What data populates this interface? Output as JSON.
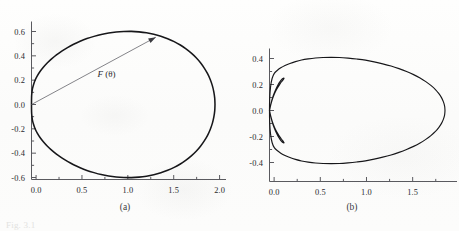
{
  "figure": {
    "caption_partial": "Fig. 3.1",
    "panels": [
      {
        "id": "a",
        "label": "(a)"
      },
      {
        "id": "b",
        "label": "(b)"
      }
    ]
  },
  "chart_data": [
    {
      "type": "line",
      "panel": "a",
      "title": "",
      "subcaption": "(a)",
      "description": "Cardioid-like closed polar curve r = F(theta), drawn in Cartesian x-y coordinates, with a radius vector annotated F (theta) drawn from the origin to a point on the upper part of the curve.",
      "xlabel": "",
      "ylabel": "",
      "xlim": [
        -0.05,
        2.12
      ],
      "ylim": [
        -0.72,
        0.7
      ],
      "xticks": [
        0.0,
        0.5,
        1.0,
        1.5,
        2.0
      ],
      "xtick_labels": [
        "0.0",
        "0.5",
        "1.0",
        "1.5",
        "2.0"
      ],
      "yticks": [
        -0.6,
        -0.4,
        -0.2,
        0.0,
        0.2,
        0.4,
        0.6
      ],
      "ytick_labels": [
        "-0.6",
        "-0.4",
        "-0.2",
        "0.0",
        "0.2",
        "0.4",
        "0.6"
      ],
      "x_minor_ticks": [
        0.25,
        0.75,
        1.25,
        1.75
      ],
      "y_minor_ticks": [
        -0.5,
        -0.3,
        -0.1,
        0.1,
        0.3,
        0.5
      ],
      "grid": false,
      "legend": null,
      "annotations": [
        {
          "name": "radius-vector",
          "text": "F (θ)",
          "text_x": 0.72,
          "text_y": 0.225,
          "from": [
            0.0,
            0.0
          ],
          "to": [
            1.355,
            0.553
          ]
        }
      ],
      "series": [
        {
          "name": "F(theta) cardioid",
          "closed": true,
          "x": [
            2.0,
            1.997,
            1.987,
            1.971,
            1.948,
            1.919,
            1.883,
            1.842,
            1.795,
            1.742,
            1.684,
            1.622,
            1.555,
            1.484,
            1.41,
            1.333,
            1.253,
            1.172,
            1.089,
            1.006,
            0.923,
            0.841,
            0.76,
            0.681,
            0.604,
            0.53,
            0.459,
            0.392,
            0.33,
            0.272,
            0.219,
            0.171,
            0.129,
            0.093,
            0.063,
            0.039,
            0.022,
            0.01,
            0.004,
            0.001,
            0.0,
            0.001,
            0.004,
            0.01,
            0.022,
            0.039,
            0.063,
            0.093,
            0.129,
            0.171,
            0.219,
            0.272,
            0.33,
            0.392,
            0.459,
            0.53,
            0.604,
            0.681,
            0.76,
            0.841,
            0.923,
            1.006,
            1.089,
            1.172,
            1.253,
            1.333,
            1.41,
            1.484,
            1.555,
            1.622,
            1.684,
            1.742,
            1.795,
            1.842,
            1.883,
            1.919,
            1.948,
            1.971,
            1.987,
            1.997,
            2.0
          ],
          "y": [
            0.0,
            0.052,
            0.104,
            0.155,
            0.205,
            0.253,
            0.299,
            0.343,
            0.384,
            0.422,
            0.457,
            0.489,
            0.517,
            0.541,
            0.561,
            0.577,
            0.589,
            0.597,
            0.601,
            0.6,
            0.596,
            0.588,
            0.576,
            0.56,
            0.542,
            0.52,
            0.495,
            0.468,
            0.439,
            0.408,
            0.375,
            0.341,
            0.306,
            0.271,
            0.235,
            0.199,
            0.163,
            0.128,
            0.094,
            0.062,
            0.0,
            -0.062,
            -0.094,
            -0.128,
            -0.163,
            -0.199,
            -0.235,
            -0.271,
            -0.306,
            -0.341,
            -0.375,
            -0.408,
            -0.439,
            -0.468,
            -0.495,
            -0.52,
            -0.542,
            -0.56,
            -0.576,
            -0.588,
            -0.596,
            -0.6,
            -0.601,
            -0.597,
            -0.589,
            -0.577,
            -0.561,
            -0.541,
            -0.517,
            -0.489,
            -0.457,
            -0.422,
            -0.384,
            -0.343,
            -0.299,
            -0.253,
            -0.205,
            -0.155,
            -0.104,
            -0.052,
            0.0
          ],
          "x_max": 2.0,
          "y_max": 0.601,
          "y_min": -0.601
        }
      ]
    },
    {
      "type": "line",
      "panel": "b",
      "title": "",
      "subcaption": "(b)",
      "description": "Multi-lobed polar curve in Cartesian coordinates: one large teardrop-shaped main lobe extending to x about 1.9, plus two small lobes near the origin reaching y about plus/minus 0.25 and x about 0.15.",
      "xlabel": "",
      "ylabel": "",
      "xlim": [
        -0.05,
        2.02
      ],
      "ylim": [
        -0.58,
        0.55
      ],
      "xticks": [
        0.0,
        0.5,
        1.0,
        1.5
      ],
      "xtick_labels": [
        "0.0",
        "0.5",
        "1.0",
        "1.5"
      ],
      "yticks": [
        -0.4,
        -0.2,
        0.0,
        0.2,
        0.4
      ],
      "ytick_labels": [
        "-0.4",
        "-0.2",
        "0.0",
        "0.2",
        "0.4"
      ],
      "x_minor_ticks": [
        0.25,
        0.75,
        1.25,
        1.75
      ],
      "y_minor_ticks": [
        -0.3,
        -0.1,
        0.1,
        0.3
      ],
      "grid": false,
      "legend": null,
      "annotations": [],
      "series": [
        {
          "name": "main lobe",
          "closed": true,
          "x": [
            1.9,
            1.896,
            1.883,
            1.862,
            1.832,
            1.794,
            1.747,
            1.692,
            1.63,
            1.56,
            1.484,
            1.402,
            1.316,
            1.226,
            1.133,
            1.039,
            0.944,
            0.85,
            0.757,
            0.667,
            0.58,
            0.497,
            0.419,
            0.347,
            0.281,
            0.221,
            0.168,
            0.122,
            0.083,
            0.052,
            0.028,
            0.011,
            0.002,
            0.0,
            0.002,
            0.011,
            0.028,
            0.052,
            0.083,
            0.122,
            0.168,
            0.221,
            0.281,
            0.347,
            0.419,
            0.497,
            0.58,
            0.667,
            0.757,
            0.85,
            0.944,
            1.039,
            1.133,
            1.226,
            1.316,
            1.402,
            1.484,
            1.56,
            1.63,
            1.692,
            1.747,
            1.794,
            1.832,
            1.862,
            1.883,
            1.896,
            1.9
          ],
          "y": [
            0.0,
            0.033,
            0.066,
            0.099,
            0.131,
            0.163,
            0.193,
            0.222,
            0.25,
            0.276,
            0.3,
            0.322,
            0.342,
            0.359,
            0.374,
            0.387,
            0.396,
            0.403,
            0.408,
            0.409,
            0.408,
            0.404,
            0.397,
            0.388,
            0.376,
            0.362,
            0.346,
            0.328,
            0.308,
            0.286,
            0.246,
            0.18,
            0.09,
            0.0,
            -0.09,
            -0.18,
            -0.246,
            -0.286,
            -0.308,
            -0.328,
            -0.346,
            -0.362,
            -0.376,
            -0.388,
            -0.397,
            -0.404,
            -0.408,
            -0.409,
            -0.408,
            -0.403,
            -0.396,
            -0.387,
            -0.374,
            -0.359,
            -0.342,
            -0.322,
            -0.3,
            -0.276,
            -0.25,
            -0.222,
            -0.193,
            -0.163,
            -0.131,
            -0.099,
            -0.066,
            -0.033,
            0.0
          ],
          "x_max": 1.9,
          "y_max": 0.42,
          "y_min": -0.42
        },
        {
          "name": "upper small lobe",
          "closed": true,
          "x": [
            0.0,
            0.013,
            0.029,
            0.048,
            0.069,
            0.091,
            0.112,
            0.13,
            0.145,
            0.154,
            0.157,
            0.154,
            0.145,
            0.131,
            0.114,
            0.094,
            0.074,
            0.054,
            0.036,
            0.021,
            0.009,
            0.0
          ],
          "y": [
            0.0,
            0.042,
            0.082,
            0.119,
            0.152,
            0.18,
            0.203,
            0.221,
            0.234,
            0.243,
            0.248,
            0.25,
            0.247,
            0.238,
            0.222,
            0.2,
            0.172,
            0.139,
            0.104,
            0.068,
            0.033,
            0.0
          ],
          "x_max": 0.157,
          "y_max": 0.25
        },
        {
          "name": "lower small lobe",
          "closed": true,
          "x": [
            0.0,
            0.013,
            0.029,
            0.048,
            0.069,
            0.091,
            0.112,
            0.13,
            0.145,
            0.154,
            0.157,
            0.154,
            0.145,
            0.131,
            0.114,
            0.094,
            0.074,
            0.054,
            0.036,
            0.021,
            0.009,
            0.0
          ],
          "y": [
            0.0,
            -0.042,
            -0.082,
            -0.119,
            -0.152,
            -0.18,
            -0.203,
            -0.221,
            -0.234,
            -0.243,
            -0.248,
            -0.25,
            -0.247,
            -0.238,
            -0.222,
            -0.2,
            -0.172,
            -0.139,
            -0.104,
            -0.068,
            -0.033,
            0.0
          ],
          "x_max": 0.157,
          "y_min": -0.25
        }
      ]
    }
  ]
}
